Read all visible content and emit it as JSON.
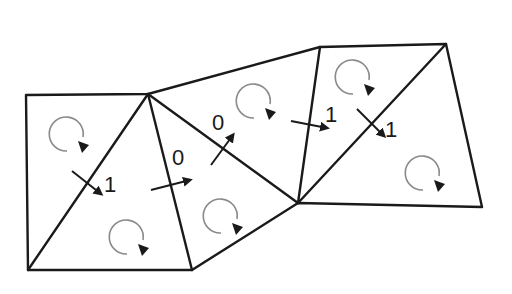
{
  "diagram": {
    "colors": {
      "edge": "#1a1a1a",
      "rotation_circle": "#8a8a8a",
      "background": "#ffffff"
    },
    "vertices": {
      "A": [
        26,
        95
      ],
      "B": [
        148,
        94
      ],
      "C": [
        28,
        270
      ],
      "D": [
        192,
        270
      ],
      "E": [
        320,
        47
      ],
      "F": [
        446,
        44
      ],
      "G": [
        298,
        203
      ],
      "H": [
        482,
        207
      ]
    },
    "triangles": [
      {
        "id": "T1",
        "vertices": [
          "A",
          "B",
          "C"
        ]
      },
      {
        "id": "T2",
        "vertices": [
          "B",
          "C",
          "D"
        ]
      },
      {
        "id": "T3",
        "vertices": [
          "B",
          "D",
          "G"
        ]
      },
      {
        "id": "T4",
        "vertices": [
          "B",
          "E",
          "G"
        ]
      },
      {
        "id": "T5",
        "vertices": [
          "E",
          "F",
          "G"
        ]
      },
      {
        "id": "T6",
        "vertices": [
          "F",
          "G",
          "H"
        ]
      }
    ],
    "rotation_icons": [
      {
        "triangle": "T1",
        "icon": "clockwise-rotation-icon"
      },
      {
        "triangle": "T2",
        "icon": "clockwise-rotation-icon"
      },
      {
        "triangle": "T3",
        "icon": "clockwise-rotation-icon"
      },
      {
        "triangle": "T4",
        "icon": "clockwise-rotation-icon"
      },
      {
        "triangle": "T5",
        "icon": "clockwise-rotation-icon"
      },
      {
        "triangle": "T6",
        "icon": "clockwise-rotation-icon"
      }
    ],
    "edge_labels": [
      {
        "edge": "B-C",
        "value": "1"
      },
      {
        "edge": "B-D",
        "value": "0"
      },
      {
        "edge": "B-G",
        "value": "0"
      },
      {
        "edge": "E-G",
        "value": "1"
      },
      {
        "edge": "F-G",
        "value": "1"
      }
    ]
  }
}
